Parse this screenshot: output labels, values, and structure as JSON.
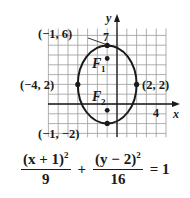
{
  "diagram": {
    "type": "ellipse-graph",
    "axes": {
      "x_label": "x",
      "y_label": "y",
      "x_tick_label": "4",
      "y_tick_label": "7"
    },
    "grid": {
      "x_min": -7,
      "x_max": 5,
      "y_min": -3.4,
      "y_max": 7.7,
      "step": 1
    },
    "ellipse": {
      "center": [
        -1,
        2
      ],
      "a_horizontal": 3,
      "b_vertical": 4
    },
    "points": [
      {
        "name": "top-vertex",
        "label": "(−1, 6)",
        "x": -1,
        "y": 6
      },
      {
        "name": "left-vertex",
        "label": "(−4, 2)",
        "x": -4,
        "y": 2
      },
      {
        "name": "right-vertex",
        "label": "(2, 2)",
        "x": 2,
        "y": 2
      },
      {
        "name": "bottom-vertex",
        "label": "(−1, −2)",
        "x": -1,
        "y": -2
      },
      {
        "name": "focus-1",
        "label": "F1",
        "x": -1,
        "y": 4.65
      },
      {
        "name": "focus-2",
        "label": "F2",
        "x": -1,
        "y": -0.65
      }
    ],
    "foci_labels": {
      "f1_main": "F",
      "f1_sub": "1",
      "f2_main": "F",
      "f2_sub": "2"
    }
  },
  "equation": {
    "num1": "(x + 1)",
    "exp1": "2",
    "den1": "9",
    "plus": "+",
    "num2": "(y − 2)",
    "exp2": "2",
    "den2": "16",
    "equals": "= 1"
  },
  "colors": {
    "ink": "#1a1a1a",
    "grid": "#9a9a9a",
    "background": "#ffffff"
  }
}
